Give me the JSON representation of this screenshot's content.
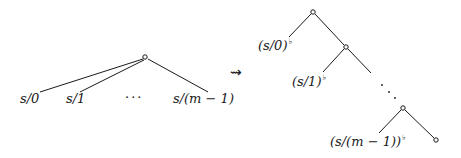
{
  "left_tree": {
    "root": {
      "x": 145,
      "y": 57
    },
    "leaves": [
      {
        "label": "s/0",
        "x": 20,
        "y": 98,
        "line_to": {
          "x": 40,
          "y": 92
        }
      },
      {
        "label": "s/1",
        "x": 66,
        "y": 98,
        "line_to": {
          "x": 80,
          "y": 92
        }
      },
      {
        "label": "s/(m − 1)",
        "x": 178,
        "y": 98,
        "line_to": {
          "x": 208,
          "y": 92
        }
      }
    ],
    "ellipsis": "···"
  },
  "transform_arrow": "⇝",
  "right_tree": {
    "nodes": [
      {
        "x": 313,
        "y": 12
      },
      {
        "x": 346,
        "y": 47
      },
      {
        "x": 403,
        "y": 108
      },
      {
        "x": 436,
        "y": 140
      }
    ],
    "labels": [
      {
        "base": "(s/0)",
        "sup": "♭",
        "x": 262,
        "y": 38
      },
      {
        "base": "(s/1)",
        "sup": "♭",
        "x": 300,
        "y": 74
      },
      {
        "base": "(s/(m − 1))",
        "sup": "♭",
        "x": 340,
        "y": 135
      }
    ],
    "diagonal_dots": "⋱"
  }
}
